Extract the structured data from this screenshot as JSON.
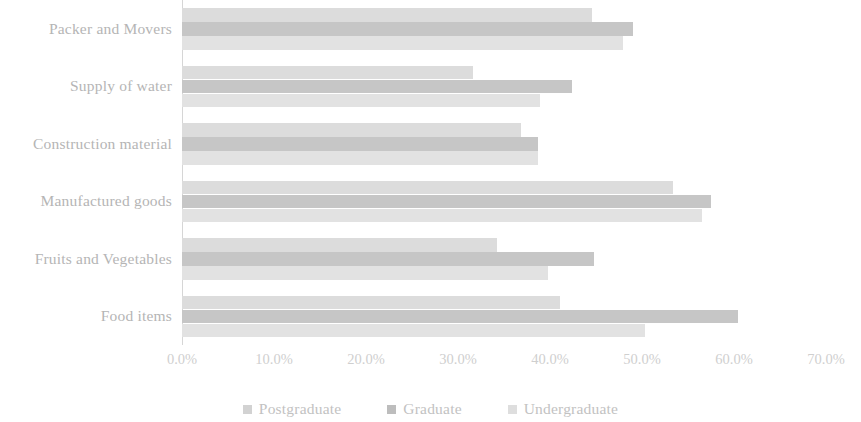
{
  "chart_data": {
    "type": "bar",
    "orientation": "horizontal",
    "title": "",
    "subtitle": "",
    "xlabel": "",
    "ylabel": "",
    "grid": false,
    "legend_position": "bottom",
    "xlim": [
      0,
      70
    ],
    "xtick_labels": [
      "0.0%",
      "10.0%",
      "20.0%",
      "30.0%",
      "40.0%",
      "50.0%",
      "60.0%",
      "70.0%"
    ],
    "xtick_values": [
      0,
      10,
      20,
      30,
      40,
      50,
      60,
      70
    ],
    "categories": [
      "Packer and Movers",
      "Supply of water",
      "Construction material",
      "Manufactured goods",
      "Fruits and Vegetables",
      "Food items"
    ],
    "series": [
      {
        "name": "Postgraduate",
        "color": "#dcdcdc",
        "values": [
          44.6,
          31.6,
          36.8,
          53.4,
          34.2,
          41.1
        ]
      },
      {
        "name": "Graduate",
        "color": "#c6c6c6",
        "values": [
          49.0,
          42.4,
          38.7,
          57.5,
          44.8,
          60.4
        ]
      },
      {
        "name": "Undergraduate",
        "color": "#e2e2e2",
        "values": [
          47.9,
          38.9,
          38.7,
          56.5,
          39.8,
          50.3
        ]
      }
    ]
  },
  "legend": {
    "items": [
      {
        "label": "Postgraduate",
        "color": "#d2d2d2"
      },
      {
        "label": "Graduate",
        "color": "#bdbdbd"
      },
      {
        "label": "Undergraduate",
        "color": "#dedede"
      }
    ]
  }
}
